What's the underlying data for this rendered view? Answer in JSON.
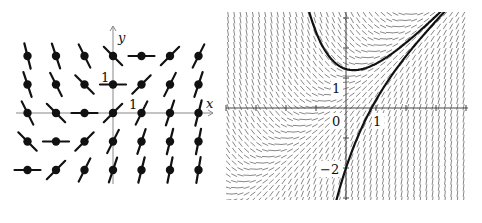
{
  "figures": [
    {
      "id": "left",
      "kind": "direction-field-grid",
      "equation": "dy/dx = x - y + 1",
      "origin_px": [
        113,
        113
      ],
      "unit_px": 28.5,
      "x_range": [
        -3,
        3
      ],
      "y_range": [
        -2,
        2
      ],
      "segment_half_length_px": 13,
      "dot_radius_px": 4.2,
      "axes": {
        "x_label": "x",
        "y_label": "y",
        "x_tick_label": "1",
        "y_tick_label": "1",
        "x_axis_px": [
          16,
          213
        ],
        "y_axis_px": [
          222,
          26
        ]
      },
      "colors": {
        "segment": "#111111",
        "axis": "#888888",
        "label": "#111111"
      }
    },
    {
      "id": "right",
      "kind": "dense-direction-field-with-solutions",
      "equation": "dy/dx = x - y + 1",
      "origin_px": [
        124,
        108
      ],
      "unit_px": 30,
      "plot_box_px": [
        4,
        12,
        246,
        200
      ],
      "grid_step_px": 6.2,
      "segment_half_length_px": 3.2,
      "axes": {
        "x_tick_labels": [
          "0",
          "1"
        ],
        "y_tick_labels": [
          "1",
          "-2"
        ],
        "x_ticks": [
          -4,
          -3,
          -2,
          -1,
          1,
          2,
          3,
          4
        ],
        "y_ticks": [
          -3,
          -2,
          -1,
          1,
          2,
          3
        ]
      },
      "solution_curves": [
        {
          "name": "upper-solution-curve",
          "C": 1.3,
          "formula": "y = x + C e^(-x)"
        },
        {
          "name": "lower-solution-curve",
          "C": -2,
          "formula": "y = x + C e^(-x)"
        }
      ],
      "colors": {
        "field": "#555555",
        "curve": "#111111",
        "axis": "#444444",
        "label": "#111111"
      }
    }
  ]
}
